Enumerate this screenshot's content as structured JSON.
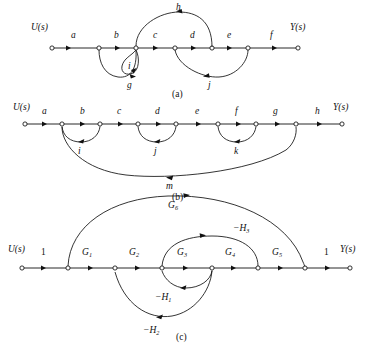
{
  "figure": {
    "type": "signal-flow-graphs",
    "background": "#ffffff",
    "ink": "#111111",
    "panels": [
      {
        "id": "a",
        "caption": "(a)",
        "input_label": "U(s)",
        "output_label": "Y(s)",
        "forward_path_labels": [
          "a",
          "b",
          "c",
          "d",
          "e",
          "f"
        ],
        "node_count": 7,
        "branches": [
          {
            "label": "h",
            "kind": "feedback-upper",
            "from_node": 4,
            "to_node": 2,
            "direction": "right-to-left"
          },
          {
            "label": "i",
            "kind": "self-loop",
            "at_node": 2
          },
          {
            "label": "g",
            "kind": "feedback-lower",
            "from_node": 3,
            "to_node": 2,
            "direction": "right-to-left"
          },
          {
            "label": "j",
            "kind": "feedback-lower",
            "from_node": 5,
            "to_node": 3,
            "direction": "right-to-left"
          }
        ]
      },
      {
        "id": "b",
        "caption": "(b)",
        "input_label": "U(s)",
        "output_label": "Y(s)",
        "forward_path_labels": [
          "a",
          "b",
          "c",
          "d",
          "e",
          "f",
          "g",
          "h"
        ],
        "node_count": 9,
        "branches": [
          {
            "label": "i",
            "kind": "feedback-lower",
            "from_node": 2,
            "to_node": 1
          },
          {
            "label": "j",
            "kind": "feedback-lower",
            "from_node": 4,
            "to_node": 3
          },
          {
            "label": "k",
            "kind": "feedback-lower",
            "from_node": 6,
            "to_node": 5
          },
          {
            "label": "m",
            "kind": "feedback-long",
            "from_node": 7,
            "to_node": 1
          }
        ]
      },
      {
        "id": "c",
        "caption": "(c)",
        "input_label": "U(s)",
        "output_label": "Y(s)",
        "forward_path_labels": [
          "1",
          "G",
          "G",
          "G",
          "G",
          "G",
          "1"
        ],
        "forward_path_subs": [
          "",
          "1",
          "2",
          "3",
          "4",
          "5",
          ""
        ],
        "node_count": 8,
        "branches": [
          {
            "label": "G",
            "sub": "6",
            "kind": "feedforward-upper",
            "from_node": 1,
            "to_node": 6
          },
          {
            "label": "−H",
            "sub": "3",
            "kind": "feedback-upper",
            "from_node": 6,
            "to_node": 1
          },
          {
            "label": "−H",
            "sub": "1",
            "kind": "feedback-lower-inner",
            "from_node": 4,
            "to_node": 3
          },
          {
            "label": "−H",
            "sub": "2",
            "kind": "feedback-lower-outer",
            "from_node": 4,
            "to_node": 2
          }
        ]
      }
    ]
  }
}
